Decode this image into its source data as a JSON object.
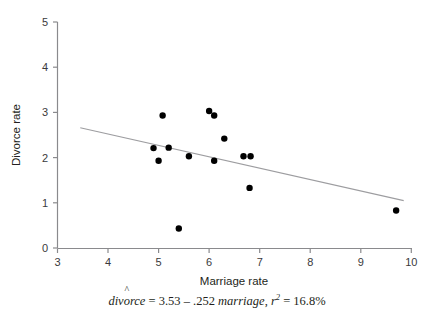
{
  "chart_data": {
    "type": "scatter",
    "title": "",
    "xlabel": "Marriage rate",
    "ylabel": "Divorce rate",
    "xlim": [
      3,
      10
    ],
    "ylim": [
      0,
      5
    ],
    "xticks": [
      "3",
      "4",
      "5",
      "6",
      "7",
      "8",
      "9",
      "10"
    ],
    "yticks": [
      "0",
      "1",
      "2",
      "3",
      "4",
      "5"
    ],
    "grid": false,
    "legend": false,
    "marker_color": "#000000",
    "fit_line_color": "#9d9da0",
    "points": [
      {
        "x": 4.9,
        "y": 2.21
      },
      {
        "x": 5.0,
        "y": 1.93
      },
      {
        "x": 5.08,
        "y": 2.93
      },
      {
        "x": 5.2,
        "y": 2.22
      },
      {
        "x": 5.4,
        "y": 0.43
      },
      {
        "x": 5.6,
        "y": 2.03
      },
      {
        "x": 6.0,
        "y": 3.03
      },
      {
        "x": 6.1,
        "y": 2.93
      },
      {
        "x": 6.1,
        "y": 1.93
      },
      {
        "x": 6.3,
        "y": 2.42
      },
      {
        "x": 6.68,
        "y": 2.03
      },
      {
        "x": 6.82,
        "y": 2.03
      },
      {
        "x": 6.8,
        "y": 1.33
      },
      {
        "x": 9.7,
        "y": 0.83
      }
    ],
    "fit_line": {
      "intercept": 3.53,
      "slope": -0.252,
      "x_start": 3.45,
      "x_end": 9.85
    },
    "annotation": {
      "response": "divorce",
      "hat": "^",
      "equals": " = ",
      "intercept": "3.53",
      "operator": " – ",
      "slope": ".252",
      "predictor": " marriage",
      "separator": ", ",
      "r_symbol": "r",
      "r_exponent": "2",
      "r_equals": " = ",
      "r_value": "16.8%",
      "full_text": "divorce = 3.53 – .252 marriage, r2 = 16.8%"
    }
  }
}
